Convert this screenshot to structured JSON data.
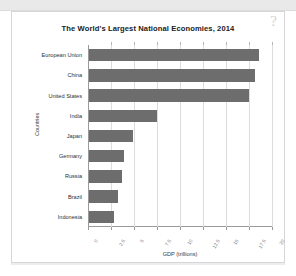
{
  "window": {
    "help_glyph": "?",
    "help_name": "help-question-mark"
  },
  "chart_data": {
    "type": "bar",
    "orientation": "horizontal",
    "title": "The World's Largest National Economies, 2014",
    "xlabel": "GDP (trillions)",
    "ylabel": "Countries",
    "categories": [
      "European Union",
      "China",
      "United States",
      "India",
      "Japan",
      "Germany",
      "Russia",
      "Brazil",
      "Indonesia"
    ],
    "values": [
      18.5,
      18.0,
      17.4,
      7.4,
      4.8,
      3.8,
      3.6,
      3.1,
      2.7
    ],
    "xlim": [
      0,
      20
    ],
    "xticks": [
      0,
      2.5,
      5,
      7.5,
      10,
      12.5,
      15,
      17.5,
      20
    ],
    "xticklabels": [
      "0",
      "2.5",
      "5",
      "7.5",
      "10",
      "12.5",
      "15",
      "17.5",
      "20"
    ],
    "grid": true,
    "legend": false,
    "bar_color": "#6d6d6d",
    "background": "#ffffff"
  }
}
